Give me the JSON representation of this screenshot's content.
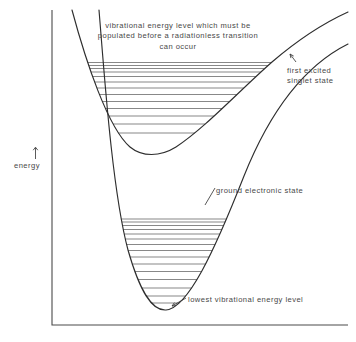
{
  "figure": {
    "kind": "potential-energy-curve-diagram",
    "background_color": "#ffffff",
    "ink_color": "#2e2e2e",
    "text_color": "#484848",
    "width": 356,
    "height": 342
  },
  "axes": {
    "y_axis_label": "energy",
    "y_axis_arrow_glyph": "↑",
    "origin": {
      "x": 52,
      "y": 325
    },
    "y_top": 10,
    "x_right": 348,
    "ticks": [],
    "x_axis_label": ""
  },
  "annotations": {
    "top_caption": {
      "line1": "vibrational energy level which must be",
      "line2": "populated before a radiationless transition",
      "line3": "can occur"
    },
    "first_excited": {
      "line1": "first excited",
      "line2": "singlet state"
    },
    "ground_state": "ground electronic state",
    "lowest_vibrational": "lowest vibrational energy level"
  },
  "chart_data": {
    "type": "line",
    "title": "",
    "xlabel": "",
    "ylabel": "energy",
    "grid": false,
    "legend": "none",
    "curves": [
      {
        "name": "first excited singlet state",
        "role": "upper-potential-well",
        "path": "M 72 10 C 86 62, 108 128, 130 147 C 142 157, 160 157, 176 147 C 205 128, 238 92, 272 62 C 300 38, 326 22, 348 12",
        "minimum": {
          "x": 152,
          "y": 152
        }
      },
      {
        "name": "ground electronic state",
        "role": "lower-potential-well",
        "path": "M 99 10 C 104 70, 112 190, 128 250 C 140 292, 152 311, 166 310 C 188 308, 214 252, 244 176 C 268 116, 300 68, 348 44",
        "minimum": {
          "x": 163,
          "y": 310
        }
      }
    ],
    "crossing_point": {
      "x": 272,
      "y": 62
    },
    "upper_well_levels": {
      "count": 13,
      "description": "vibrational energy levels of the first excited singlet state",
      "y_values": [
        62.5,
        65.5,
        68.5,
        72,
        76.5,
        82,
        88,
        94.5,
        101.5,
        108.5,
        116,
        124,
        133
      ],
      "top_level_is_crossing_level": true
    },
    "lower_well_levels": {
      "count": 15,
      "description": "vibrational energy levels of the ground electronic state",
      "y_values": [
        219,
        222,
        225.5,
        229.5,
        234,
        239,
        244.5,
        250.5,
        257,
        264,
        271.5,
        279.5,
        288,
        296,
        303
      ]
    }
  },
  "leaders": [
    {
      "name": "first-excited-leader",
      "path": "M 296 62 L 290 54",
      "has_arrow": true
    },
    {
      "name": "ground-state-leader",
      "path": "M 215 188 L 205 205",
      "has_arrow": false
    },
    {
      "name": "lowest-vib-leader",
      "path": "M 186 298 L 172 306",
      "has_arrow": true
    }
  ]
}
